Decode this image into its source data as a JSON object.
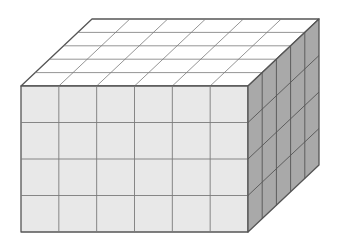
{
  "diagram": {
    "type": "rectangular-prism-unit-cubes",
    "dimensions": {
      "length": 6,
      "depth": 5,
      "height": 4
    },
    "unit_cube_count": 120,
    "geometry": {
      "front": {
        "x1": 21,
        "y1": 86,
        "x2": 248,
        "y2": 232
      },
      "depth_offset": {
        "dx": 71,
        "dy": -67
      }
    },
    "colors": {
      "top_face": "#ffffff",
      "front_face": "#e8e8e8",
      "side_face": "#a9a9a9",
      "grid_line": "#7a7a7a",
      "edge_line": "#555555",
      "background": "#ffffff"
    }
  }
}
